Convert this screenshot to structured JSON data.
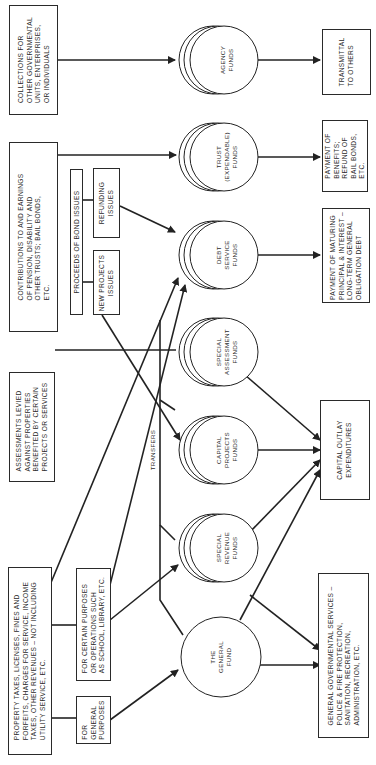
{
  "diagram": {
    "orientation": "rotated 90 degrees counter-clockwise",
    "sources": {
      "collections": "COLLECTIONS FOR\nOTHER GOVERNMENTAL\nUNITS, ENTERPRISES,\nOR INDIVIDUALS",
      "contributions": "CONTRIBUTIONS TO AND EARNINGS\nOF PENSION, DISABILITY AND\nOTHER TRUSTS; BAIL BONDS,\nETC.",
      "bond_proceeds": "PROCEEDS OF BOND ISSUES",
      "refunding_issues": "REFUNDING\nISSUES",
      "new_projects_issues": "NEW PROJECTS\nISSUES",
      "assessments": "ASSESSMENTS LEVIED\nAGAINST PROPERTIES\nBENEFITED BY CERTAIN\nPROJECTS OR SERVICES",
      "property_taxes": "PROPERTY TAXES, LICENSES, FINES AND\nFORFEITS, CHARGES FOR SERVICE, INCOME\nTAXES, OTHER REVENUES – NOT INCLUDING\nUTILITY SERVICE, ETC.",
      "certain_purposes": "FOR CERTAIN PURPOSES\nOR OPERATIONS SUCH\nAS SCHOOL, LIBRARY, ETC.",
      "general_purposes": "FOR\nGENERAL\nPURPOSES"
    },
    "funds": {
      "agency": "AGENCY\nFUNDS",
      "trust": "TRUST\n(EXPENDABLE)\nFUNDS",
      "debt_service": "DEBT\nSERVICE\nFUNDS",
      "special_assessment": "SPECIAL\nASSESSMENT\nFUNDS",
      "capital_projects": "CAPITAL\nPROJECTS\nFUNDS",
      "special_revenue": "SPECIAL\nREVENUE\nFUNDS",
      "general": "THE\nGENERAL\nFUND"
    },
    "transfers_label": "TRANSFERS",
    "uses": {
      "transmittal": "TRANSMITTAL\nTO OTHERS",
      "benefits": "PAYMENT OF\nBENEFITS;\nREFUND OF\nBAIL BONDS,\nETC.",
      "maturing": "PAYMENT OF MATURING\nPRINCIPAL & INTEREST –\nLONG-TERM GENERAL\nOBLIGATION DEBT",
      "capital_outlay": "CAPITAL OUTLAY\nEXPENDITURES",
      "general_services": "GENERAL GOVERNMENTAL SERVICES –\nPOLICE & FIRE PROTECTION,\nSANITATION, RECREATION,\nADMINISTRATION, ETC."
    }
  }
}
